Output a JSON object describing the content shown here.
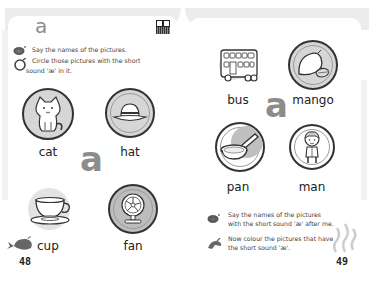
{
  "left_page": {
    "header_letter": "a",
    "qr_icon": "qr-code-icon",
    "instructions": [
      {
        "icon": "speaking-shell-icon",
        "text": "Say the names of the pictures."
      },
      {
        "icon": "circle-pencil-icon",
        "line1": "Circle those pictures with the short",
        "line2": "sound 'æ' in it."
      }
    ],
    "big_letter": "a",
    "pictures": [
      {
        "word": "cat",
        "icon": "cat-icon",
        "circled": true
      },
      {
        "word": "hat",
        "icon": "hat-icon",
        "circled": true
      },
      {
        "word": "cup",
        "icon": "cup-icon",
        "circled": false
      },
      {
        "word": "fan",
        "icon": "fan-icon",
        "circled": true
      }
    ],
    "page_number": "48",
    "corner_icon": "whale-icon"
  },
  "right_page": {
    "big_letter": "a",
    "pictures": [
      {
        "word": "bus",
        "icon": "bus-icon",
        "circled": false
      },
      {
        "word": "mango",
        "icon": "mango-icon",
        "circled": true
      },
      {
        "word": "pan",
        "icon": "pan-icon",
        "circled": true
      },
      {
        "word": "man",
        "icon": "man-icon",
        "circled": true
      }
    ],
    "instructions": [
      {
        "icon": "speaking-shell-icon",
        "line1": "Say the names of the pictures",
        "line2": "with the short sound 'æ' after me."
      },
      {
        "icon": "colouring-hand-icon",
        "line1": "Now colour the pictures that have",
        "line2": "the short sound 'æ'."
      }
    ],
    "page_number": "49",
    "corner_icon": "steam-swirl-icon"
  },
  "colors": {
    "ink": "#222222",
    "gray_letter": "#8c8c8c",
    "shade": "#d6d6d6",
    "band": "#ececec"
  }
}
